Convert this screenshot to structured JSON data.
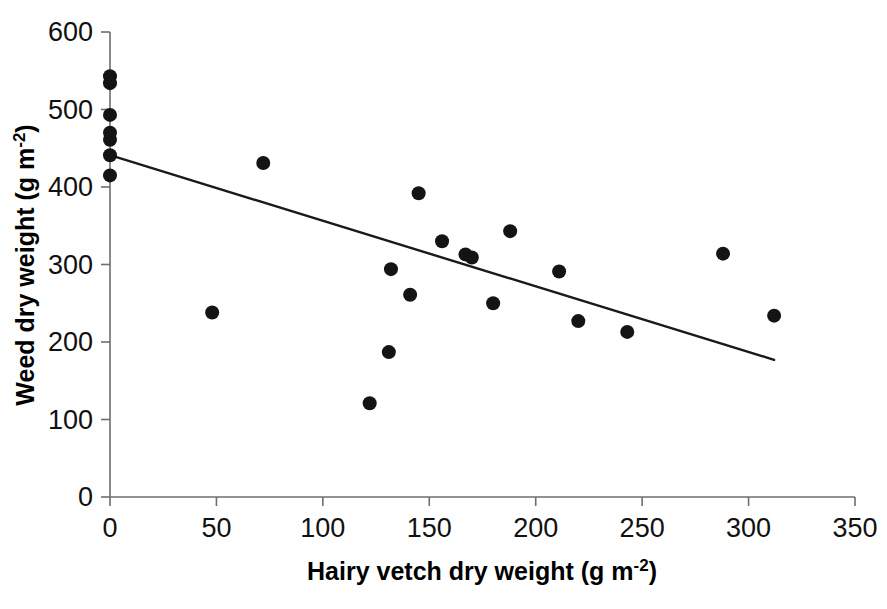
{
  "chart_data": {
    "type": "scatter",
    "title": "",
    "xlabel": "Hairy vetch dry weight (g m-2)",
    "xlabel_main": "Hairy vetch dry weight (g m",
    "xlabel_sup": "-2",
    "xlabel_tail": ")",
    "ylabel": "Weed dry weight (g m-2)",
    "ylabel_main": "Weed dry weight (g m",
    "ylabel_sup": "-2",
    "ylabel_tail": ")",
    "xlim": [
      0,
      350
    ],
    "ylim": [
      0,
      600
    ],
    "xticks": [
      0,
      50,
      100,
      150,
      200,
      250,
      300,
      350
    ],
    "yticks": [
      0,
      100,
      200,
      300,
      400,
      500,
      600
    ],
    "xtick_labels": [
      "0",
      "50",
      "100",
      "150",
      "200",
      "250",
      "300",
      "350"
    ],
    "ytick_labels": [
      "0",
      "100",
      "200",
      "300",
      "400",
      "500",
      "600"
    ],
    "grid": false,
    "legend": false,
    "marker": "filled-circle",
    "marker_color": "#141414",
    "marker_size": 7,
    "points": [
      {
        "x": 0,
        "y": 543
      },
      {
        "x": 0,
        "y": 534
      },
      {
        "x": 0,
        "y": 493
      },
      {
        "x": 0,
        "y": 470
      },
      {
        "x": 0,
        "y": 461
      },
      {
        "x": 0,
        "y": 441
      },
      {
        "x": 0,
        "y": 415
      },
      {
        "x": 48,
        "y": 238
      },
      {
        "x": 72,
        "y": 431
      },
      {
        "x": 122,
        "y": 121
      },
      {
        "x": 131,
        "y": 187
      },
      {
        "x": 132,
        "y": 294
      },
      {
        "x": 141,
        "y": 261
      },
      {
        "x": 145,
        "y": 392
      },
      {
        "x": 156,
        "y": 330
      },
      {
        "x": 167,
        "y": 313
      },
      {
        "x": 170,
        "y": 309
      },
      {
        "x": 180,
        "y": 250
      },
      {
        "x": 188,
        "y": 343
      },
      {
        "x": 211,
        "y": 291
      },
      {
        "x": 220,
        "y": 227
      },
      {
        "x": 243,
        "y": 213
      },
      {
        "x": 288,
        "y": 314
      },
      {
        "x": 312,
        "y": 234
      }
    ],
    "trend_line": {
      "type": "linear-fit",
      "x_start": 0,
      "y_start": 441,
      "x_end": 312,
      "y_end": 177,
      "color": "#1a1a1a"
    }
  }
}
